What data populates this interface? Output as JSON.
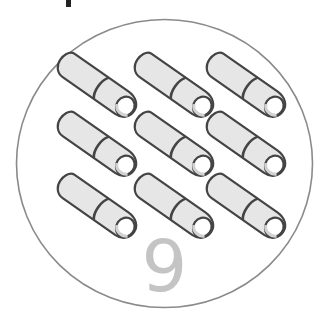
{
  "card": {
    "count_label": "9",
    "item_name": "slipper",
    "item_count": 9,
    "layout": {
      "rows": 3,
      "columns": 3
    }
  },
  "colors": {
    "circle_stroke": "#8a8a8a",
    "slipper_fill": "#e6e6e6",
    "slipper_shade": "#d2d2d2",
    "slipper_stroke": "#444444",
    "number_color": "#c4c4c4"
  },
  "items": [
    {
      "row": 1,
      "col": 1,
      "icon": "slipper-icon"
    },
    {
      "row": 1,
      "col": 2,
      "icon": "slipper-icon"
    },
    {
      "row": 1,
      "col": 3,
      "icon": "slipper-icon"
    },
    {
      "row": 2,
      "col": 1,
      "icon": "slipper-icon"
    },
    {
      "row": 2,
      "col": 2,
      "icon": "slipper-icon"
    },
    {
      "row": 2,
      "col": 3,
      "icon": "slipper-icon"
    },
    {
      "row": 3,
      "col": 1,
      "icon": "slipper-icon"
    },
    {
      "row": 3,
      "col": 2,
      "icon": "slipper-icon"
    },
    {
      "row": 3,
      "col": 3,
      "icon": "slipper-icon"
    }
  ]
}
